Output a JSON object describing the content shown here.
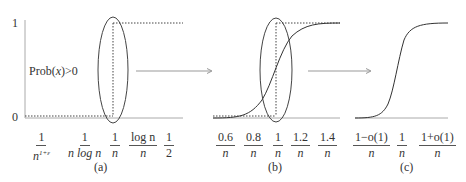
{
  "figure": {
    "panels": [
      {
        "id": "a",
        "caption": "(a)",
        "y_tick_top": "1",
        "y_tick_bottom": "0",
        "ylabel_text": "Prob(x)>0",
        "ylabel_prefix": "Prob(",
        "ylabel_var": "x",
        "ylabel_suffix": ")>0",
        "x_ticks": [
          {
            "num": "1",
            "den": "n",
            "den_sup": "1+ε"
          },
          {
            "num": "1",
            "den": "n log n"
          },
          {
            "num": "1",
            "den": "n"
          },
          {
            "num": "log n",
            "den": "n"
          },
          {
            "num": "1",
            "den": "2"
          }
        ],
        "curve": "step function at 1/n"
      },
      {
        "id": "b",
        "caption": "(b)",
        "x_ticks": [
          {
            "num": "0.6",
            "den": "n"
          },
          {
            "num": "0.8",
            "den": "n"
          },
          {
            "num": "1",
            "den": "n"
          },
          {
            "num": "1.2",
            "den": "n"
          },
          {
            "num": "1.4",
            "den": "n"
          }
        ],
        "curve": "sigmoid overlaid with dotted step at 1/n"
      },
      {
        "id": "c",
        "caption": "(c)",
        "x_ticks": [
          {
            "num": "1−o(1)",
            "den": "n"
          },
          {
            "num": "1",
            "den": "n"
          },
          {
            "num": "1+o(1)",
            "den": "n"
          }
        ],
        "curve": "sharp sigmoid threshold"
      }
    ],
    "arrows": [
      {
        "from": "a",
        "to": "b",
        "icon": "right-arrow-icon"
      },
      {
        "from": "b",
        "to": "c",
        "icon": "right-arrow-icon"
      }
    ],
    "colors": {
      "line": "#333333",
      "axis": "#aaaaaa",
      "arrow": "#999999"
    }
  }
}
